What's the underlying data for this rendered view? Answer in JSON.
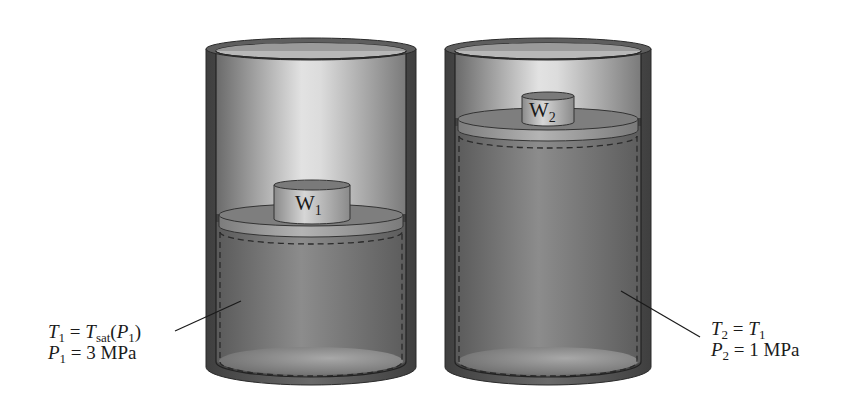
{
  "diagram": {
    "type": "piston-cylinder comparison",
    "cylinders": [
      {
        "id": "state-1",
        "weight_label": "W",
        "weight_subscript": "1",
        "state_lines": [
          {
            "var": "T",
            "sub": "1",
            "eq": " = ",
            "rhs_var": "T",
            "rhs_sub": "sat",
            "rhs_tail": "(",
            "rhs_var2": "P",
            "rhs_sub2": "1",
            "rhs_end": ")"
          },
          {
            "var": "P",
            "sub": "1",
            "eq": " = 3 MPa"
          }
        ]
      },
      {
        "id": "state-2",
        "weight_label": "W",
        "weight_subscript": "2",
        "state_lines": [
          {
            "var": "T",
            "sub": "2",
            "eq": " = ",
            "rhs_var": "T",
            "rhs_sub": "1"
          },
          {
            "var": "P",
            "sub": "2",
            "eq": " = 1 MPa"
          }
        ]
      }
    ],
    "colors": {
      "wall_dark": "#4a4a4a",
      "wall_mid": "#6e6e6e",
      "interior_light": "#d8d8d8",
      "fluid": "#7a7a7a",
      "piston": "#8c8c8c",
      "weight": "#b5b5b5"
    }
  }
}
